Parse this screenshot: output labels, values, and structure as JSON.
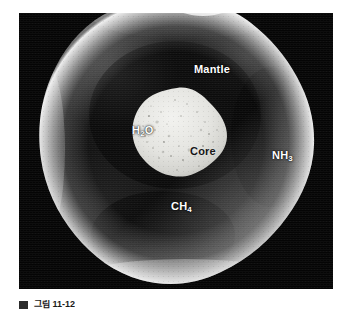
{
  "figure": {
    "panel": {
      "background_color": "#050505",
      "x": 19,
      "y": 13,
      "width": 314,
      "height": 276
    },
    "body": {
      "name": "planet-body",
      "description": "Irregular lumpy planetary body with glowing limb",
      "fill_dark": "#0e0e0e",
      "rim_bright": "#d8d8d8"
    },
    "core": {
      "name": "planet-core",
      "description": "Irregular light-grey rocky core with speckled texture",
      "fill": "#e2e2e0"
    },
    "labels": [
      {
        "id": "mantle",
        "text": "Mantle",
        "style": "light",
        "sub": ""
      },
      {
        "id": "h2o",
        "text": "H",
        "style": "light",
        "sub": "2",
        "tail": "O"
      },
      {
        "id": "core",
        "text": "Core",
        "style": "dark",
        "sub": ""
      },
      {
        "id": "nh3",
        "text": "NH",
        "style": "light",
        "sub": "3",
        "tail": ""
      },
      {
        "id": "ch4",
        "text": "CH",
        "style": "light",
        "sub": "4",
        "tail": ""
      }
    ],
    "label_text": {
      "mantle": "Mantle",
      "h2o_main": "H",
      "h2o_sub": "2",
      "h2o_tail": "O",
      "core": "Core",
      "nh3_main": "NH",
      "nh3_sub": "3",
      "ch4_main": "CH",
      "ch4_sub": "4"
    }
  },
  "caption": {
    "marker": "",
    "text": "그림 11-12"
  }
}
